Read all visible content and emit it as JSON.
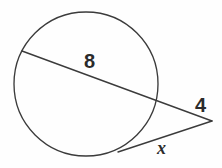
{
  "figure": {
    "kind": "circle-secant-tangent-geometry-diagram",
    "background_color": "#fefefe",
    "stroke_color": "#3b3b3b",
    "text_color": "#2b2b2b",
    "labels": {
      "chord": "8",
      "external_secant": "4",
      "tangent": "x"
    },
    "geometry": {
      "circle": {
        "cx": 86,
        "cy": 84,
        "r": 72
      },
      "secant": {
        "far_intersection": {
          "x": 22,
          "y": 51
        },
        "near_intersection": {
          "x": 152,
          "y": 100
        },
        "external_vertex": {
          "x": 212,
          "y": 121
        }
      },
      "tangent": {
        "tangent_point": {
          "x": 118,
          "y": 152
        },
        "external_vertex": {
          "x": 212,
          "y": 121
        }
      }
    }
  }
}
